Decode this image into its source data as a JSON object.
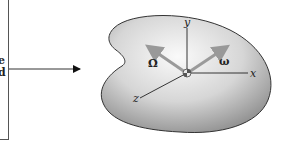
{
  "left_box": {
    "text_lines": [
      "e",
      "d"
    ]
  },
  "figure": {
    "axes": {
      "x": "x",
      "y": "y",
      "z": "z"
    },
    "vectors": {
      "Omega": "Ω",
      "omega": "ω"
    },
    "colors": {
      "body_fill_light": "#f4f4f4",
      "body_fill_dark": "#9a9a9a",
      "outline": "#333333",
      "vector": "#9a9a9a",
      "axis": "#222222"
    }
  }
}
